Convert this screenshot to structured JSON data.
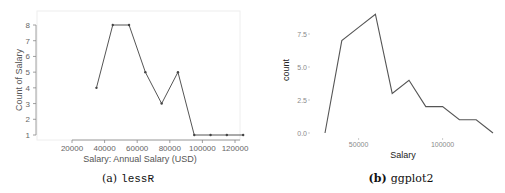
{
  "chart_data": [
    {
      "type": "line",
      "caption_label": "(a)",
      "caption_name": "lessR",
      "title": "",
      "xlabel": "Salary: Annual Salary (USD)",
      "ylabel": "Count of Salary",
      "x": [
        35000,
        45000,
        55000,
        65000,
        75000,
        85000,
        95000,
        105000,
        115000,
        125000
      ],
      "values": [
        4,
        8,
        8,
        5,
        3,
        5,
        1,
        1,
        1,
        1
      ],
      "x_ticks": [
        "20000",
        "40000",
        "60000",
        "80000",
        "100000",
        "120000"
      ],
      "y_ticks": [
        "1",
        "2",
        "3",
        "4",
        "5",
        "6",
        "7",
        "8"
      ],
      "xlim": [
        20000,
        125000
      ],
      "ylim": [
        1,
        8
      ],
      "markers": true,
      "grid": false,
      "legend": "none",
      "line_color": "#555555"
    },
    {
      "type": "line",
      "caption_label": "(b)",
      "caption_name": "ggplot2",
      "title": "",
      "xlabel": "Salary",
      "ylabel": "count",
      "x": [
        30000,
        40000,
        50000,
        60000,
        70000,
        80000,
        90000,
        100000,
        110000,
        120000,
        130000
      ],
      "values": [
        0,
        7,
        8,
        9,
        3,
        4,
        2,
        2,
        1,
        1,
        0
      ],
      "x_ticks": [
        "50000",
        "100000"
      ],
      "y_ticks": [
        "0.0",
        "2.5",
        "5.0",
        "7.5"
      ],
      "xlim": [
        30000,
        130000
      ],
      "ylim": [
        0,
        9
      ],
      "markers": false,
      "grid": false,
      "legend": "none",
      "line_color": "#555555"
    }
  ]
}
